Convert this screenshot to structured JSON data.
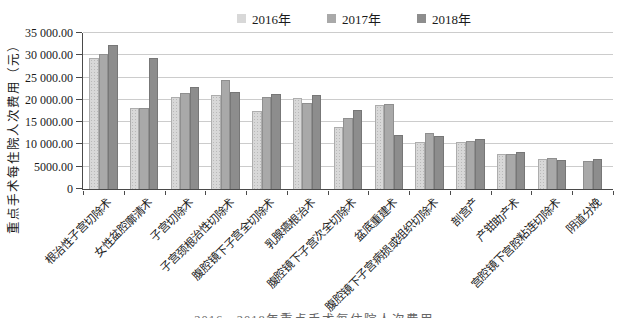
{
  "legend": {
    "items": [
      {
        "label": "2016年",
        "color": "#d8d8d8"
      },
      {
        "label": "2017年",
        "color": "#a9a9a9"
      },
      {
        "label": "2018年",
        "color": "#8d8d8d"
      }
    ]
  },
  "chart_data": {
    "type": "bar",
    "title": "",
    "xlabel": "",
    "ylabel": "重点手术每住院人次费用（元）",
    "ylim": [
      0,
      35000
    ],
    "ytick_step": 5000,
    "ytick_labels": [
      "35 000.00",
      "30 000.00",
      "25 000.00",
      "20 000.00",
      "15 000.00",
      "10 000.00",
      "5000.00",
      "0"
    ],
    "grid": true,
    "legend_position": "top-center",
    "categories": [
      "根治性子宫切除术",
      "女性盆腔廓清术",
      "子宫切除术",
      "子宫颈根治性切除术",
      "腹腔镜下子宫全切除术",
      "乳腺癌根治术",
      "腹腔镜下子宫次全切除术",
      "盆底重建术",
      "腹腔镜下子宫病损或组织切除术",
      "剖宫产",
      "产钳助产术",
      "宫腔镜下宫腔粘连切除术",
      "阴道分娩"
    ],
    "series": [
      {
        "name": "2016年",
        "color": "#d8d8d8",
        "values": [
          29400,
          18100,
          20600,
          21000,
          17500,
          20400,
          14000,
          18800,
          10500,
          10600,
          7800,
          6800,
          null
        ]
      },
      {
        "name": "2017年",
        "color": "#a9a9a9",
        "values": [
          30200,
          18200,
          21500,
          24500,
          20700,
          19400,
          16000,
          19000,
          12500,
          10700,
          7900,
          6900,
          6300
        ]
      },
      {
        "name": "2018年",
        "color": "#8d8d8d",
        "values": [
          32200,
          29300,
          22900,
          21800,
          21300,
          21000,
          17800,
          12200,
          11900,
          11300,
          8400,
          6600,
          6800
        ]
      }
    ]
  },
  "caption": {
    "text": "2016—2018年重点手术每住院人次费用"
  }
}
